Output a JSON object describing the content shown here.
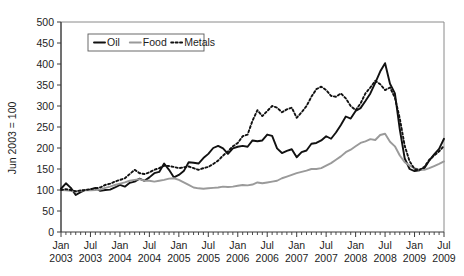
{
  "chart_data": {
    "type": "line",
    "title": "",
    "xlabel": "",
    "ylabel": "Jun 2003 = 100",
    "ylim": [
      0,
      500
    ],
    "yticks": [
      0,
      50,
      100,
      150,
      200,
      250,
      300,
      350,
      400,
      450,
      500
    ],
    "grid": false,
    "legend_position": "top-left-inside",
    "x_tick_labels": [
      {
        "month": "Jan",
        "year": "2003"
      },
      {
        "month": "Jul",
        "year": "2003"
      },
      {
        "month": "Jan",
        "year": "2004"
      },
      {
        "month": "Jul",
        "year": "2004"
      },
      {
        "month": "Jan",
        "year": "2005"
      },
      {
        "month": "Jul",
        "year": "2005"
      },
      {
        "month": "Jan",
        "year": "2006"
      },
      {
        "month": "Jul",
        "year": "2006"
      },
      {
        "month": "Jan",
        "year": "2007"
      },
      {
        "month": "Jul",
        "year": "2007"
      },
      {
        "month": "Jan",
        "year": "2008"
      },
      {
        "month": "Jul",
        "year": "2008"
      },
      {
        "month": "Jan",
        "year": "2009"
      },
      {
        "month": "Jul",
        "year": "2009"
      }
    ],
    "x": [
      "2003-01",
      "2003-02",
      "2003-03",
      "2003-04",
      "2003-05",
      "2003-06",
      "2003-07",
      "2003-08",
      "2003-09",
      "2003-10",
      "2003-11",
      "2003-12",
      "2004-01",
      "2004-02",
      "2004-03",
      "2004-04",
      "2004-05",
      "2004-06",
      "2004-07",
      "2004-08",
      "2004-09",
      "2004-10",
      "2004-11",
      "2004-12",
      "2005-01",
      "2005-02",
      "2005-03",
      "2005-04",
      "2005-05",
      "2005-06",
      "2005-07",
      "2005-08",
      "2005-09",
      "2005-10",
      "2005-11",
      "2005-12",
      "2006-01",
      "2006-02",
      "2006-03",
      "2006-04",
      "2006-05",
      "2006-06",
      "2006-07",
      "2006-08",
      "2006-09",
      "2006-10",
      "2006-11",
      "2006-12",
      "2007-01",
      "2007-02",
      "2007-03",
      "2007-04",
      "2007-05",
      "2007-06",
      "2007-07",
      "2007-08",
      "2007-09",
      "2007-10",
      "2007-11",
      "2007-12",
      "2008-01",
      "2008-02",
      "2008-03",
      "2008-04",
      "2008-05",
      "2008-06",
      "2008-07",
      "2008-08",
      "2008-09",
      "2008-10",
      "2008-11",
      "2008-12",
      "2009-01",
      "2009-02",
      "2009-03",
      "2009-04",
      "2009-05",
      "2009-06",
      "2009-07"
    ],
    "series": [
      {
        "name": "Oil",
        "color": "#111111",
        "style": "solid",
        "width": 1.9,
        "values": [
          103,
          116,
          105,
          88,
          95,
          100,
          101,
          105,
          98,
          100,
          101,
          106,
          112,
          108,
          117,
          120,
          127,
          122,
          130,
          140,
          143,
          163,
          148,
          130,
          136,
          145,
          166,
          165,
          163,
          176,
          186,
          200,
          205,
          199,
          186,
          199,
          203,
          205,
          203,
          218,
          216,
          218,
          232,
          229,
          199,
          188,
          193,
          197,
          178,
          190,
          194,
          210,
          212,
          218,
          228,
          222,
          237,
          255,
          275,
          270,
          288,
          295,
          312,
          330,
          355,
          382,
          402,
          353,
          330,
          244,
          175,
          150,
          145,
          147,
          152,
          170,
          185,
          198,
          222
        ]
      },
      {
        "name": "Food",
        "color": "#9a9a9a",
        "style": "solid",
        "width": 1.9,
        "values": [
          100,
          99,
          98,
          96,
          98,
          100,
          99,
          100,
          101,
          105,
          108,
          112,
          115,
          118,
          122,
          124,
          126,
          122,
          122,
          120,
          122,
          124,
          127,
          128,
          124,
          118,
          112,
          106,
          104,
          103,
          104,
          105,
          106,
          108,
          107,
          108,
          110,
          112,
          111,
          113,
          118,
          116,
          118,
          120,
          122,
          128,
          132,
          136,
          140,
          143,
          146,
          150,
          150,
          152,
          158,
          164,
          172,
          180,
          190,
          196,
          204,
          212,
          216,
          221,
          219,
          231,
          234,
          215,
          204,
          182,
          166,
          158,
          152,
          148,
          148,
          152,
          157,
          162,
          168
        ]
      },
      {
        "name": "Metals",
        "color": "#111111",
        "style": "dotted",
        "width": 1.9,
        "values": [
          100,
          102,
          100,
          97,
          99,
          100,
          102,
          104,
          106,
          112,
          115,
          120,
          124,
          128,
          138,
          148,
          140,
          138,
          142,
          148,
          152,
          158,
          157,
          155,
          152,
          154,
          156,
          152,
          148,
          152,
          155,
          162,
          170,
          182,
          192,
          204,
          212,
          228,
          232,
          265,
          290,
          276,
          288,
          300,
          296,
          285,
          292,
          296,
          272,
          285,
          300,
          322,
          340,
          346,
          338,
          324,
          322,
          330,
          318,
          300,
          290,
          306,
          330,
          344,
          360,
          352,
          338,
          344,
          320,
          270,
          205,
          168,
          150,
          148,
          155,
          172,
          182,
          192,
          205
        ]
      }
    ],
    "legend": [
      {
        "label": "Oil",
        "style": "solid",
        "color": "#111111"
      },
      {
        "label": "Food",
        "style": "solid",
        "color": "#9a9a9a"
      },
      {
        "label": "Metals",
        "style": "dotted",
        "color": "#111111"
      }
    ]
  }
}
